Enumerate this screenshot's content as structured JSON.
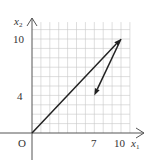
{
  "diagram": {
    "type": "vector-plot",
    "x_axis": {
      "label": "x",
      "subscript": "1",
      "ticks": [
        "7",
        "10"
      ],
      "range": [
        0,
        11
      ]
    },
    "y_axis": {
      "label": "x",
      "subscript": "2",
      "ticks": [
        "4",
        "10"
      ],
      "range": [
        0,
        12
      ]
    },
    "origin_label": "O",
    "grid": true,
    "vectors": [
      {
        "name": "vector-origin-to-10-10",
        "from": [
          0,
          0
        ],
        "to": [
          10,
          10
        ]
      },
      {
        "name": "vector-10-10-to-7-4",
        "from": [
          10,
          10
        ],
        "to": [
          7,
          4
        ]
      }
    ],
    "colors": {
      "grid": "#c8c8c8",
      "axis": "#555555",
      "vector": "#222222",
      "text": "#333333"
    }
  }
}
